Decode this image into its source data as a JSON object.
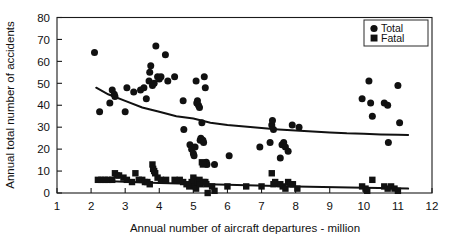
{
  "figure": {
    "cut_off_title": "",
    "background_color": "#ffffff",
    "ink_color": "#111111"
  },
  "legend": {
    "position": "top-right",
    "entries": [
      {
        "label": "Total",
        "marker": "circle-marker",
        "color": "#111111"
      },
      {
        "label": "Fatal",
        "marker": "square-marker",
        "color": "#111111"
      }
    ]
  },
  "axes": {
    "x_title": "Annual number of aircraft departures - million",
    "y_title": "Annual total number of accidents",
    "x_ticks": [
      "1",
      "2",
      "3",
      "4",
      "5",
      "6",
      "7",
      "8",
      "9",
      "10",
      "11",
      "12"
    ],
    "y_ticks": [
      "0",
      "10",
      "20",
      "30",
      "40",
      "50",
      "60",
      "70",
      "80"
    ]
  },
  "chart_data": {
    "type": "scatter",
    "title": "",
    "xlabel": "Annual number of aircraft departures - million",
    "ylabel": "Annual total number of accidents",
    "xlim": [
      1,
      12
    ],
    "ylim": [
      0,
      80
    ],
    "xticks": [
      1,
      2,
      3,
      4,
      5,
      6,
      7,
      8,
      9,
      10,
      11,
      12
    ],
    "yticks": [
      0,
      10,
      20,
      30,
      40,
      50,
      60,
      70,
      80
    ],
    "grid": false,
    "legend_position": "upper right",
    "series": [
      {
        "name": "Total",
        "marker": "circle",
        "color": "#111111",
        "points": [
          [
            2.1,
            64
          ],
          [
            2.25,
            37
          ],
          [
            2.55,
            41
          ],
          [
            2.62,
            47
          ],
          [
            2.68,
            45
          ],
          [
            2.7,
            44
          ],
          [
            3.0,
            37
          ],
          [
            3.05,
            48
          ],
          [
            3.25,
            46
          ],
          [
            3.45,
            47
          ],
          [
            3.55,
            48
          ],
          [
            3.62,
            43
          ],
          [
            3.7,
            51
          ],
          [
            3.72,
            55
          ],
          [
            3.75,
            58
          ],
          [
            3.8,
            49
          ],
          [
            3.85,
            50
          ],
          [
            3.9,
            67
          ],
          [
            3.95,
            53
          ],
          [
            4.0,
            52
          ],
          [
            4.05,
            53
          ],
          [
            4.18,
            63
          ],
          [
            4.25,
            51
          ],
          [
            4.45,
            53
          ],
          [
            4.7,
            42
          ],
          [
            4.72,
            29
          ],
          [
            4.9,
            22
          ],
          [
            4.95,
            20
          ],
          [
            5.0,
            18
          ],
          [
            5.02,
            17
          ],
          [
            5.05,
            21
          ],
          [
            5.08,
            51
          ],
          [
            5.1,
            41
          ],
          [
            5.12,
            42
          ],
          [
            5.15,
            40
          ],
          [
            5.18,
            39
          ],
          [
            5.2,
            24
          ],
          [
            5.22,
            25
          ],
          [
            5.25,
            32
          ],
          [
            5.28,
            24
          ],
          [
            5.3,
            23
          ],
          [
            5.32,
            53
          ],
          [
            5.35,
            48
          ],
          [
            5.38,
            14
          ],
          [
            5.4,
            13
          ],
          [
            5.62,
            13
          ],
          [
            6.05,
            17
          ],
          [
            6.95,
            21
          ],
          [
            7.25,
            23
          ],
          [
            7.3,
            31
          ],
          [
            7.32,
            33
          ],
          [
            7.35,
            29
          ],
          [
            7.55,
            16
          ],
          [
            7.6,
            22
          ],
          [
            7.65,
            23
          ],
          [
            7.7,
            21
          ],
          [
            7.78,
            19
          ],
          [
            7.9,
            31
          ],
          [
            8.1,
            30
          ],
          [
            9.95,
            43
          ],
          [
            10.15,
            51
          ],
          [
            10.2,
            41
          ],
          [
            10.25,
            35
          ],
          [
            10.6,
            41
          ],
          [
            10.7,
            40
          ],
          [
            10.72,
            23
          ],
          [
            11.0,
            49
          ],
          [
            11.05,
            32
          ]
        ]
      },
      {
        "name": "Fatal",
        "marker": "square",
        "color": "#111111",
        "points": [
          [
            2.2,
            6
          ],
          [
            2.3,
            6
          ],
          [
            2.4,
            6
          ],
          [
            2.5,
            6
          ],
          [
            2.62,
            6
          ],
          [
            2.7,
            9
          ],
          [
            2.75,
            8
          ],
          [
            2.82,
            8
          ],
          [
            2.95,
            7
          ],
          [
            3.05,
            6
          ],
          [
            3.2,
            5
          ],
          [
            3.3,
            9
          ],
          [
            3.4,
            6
          ],
          [
            3.5,
            6
          ],
          [
            3.58,
            5
          ],
          [
            3.65,
            5
          ],
          [
            3.72,
            4
          ],
          [
            3.8,
            13
          ],
          [
            3.82,
            11
          ],
          [
            3.85,
            10
          ],
          [
            3.88,
            9
          ],
          [
            3.95,
            7
          ],
          [
            4.05,
            6
          ],
          [
            4.2,
            6
          ],
          [
            4.45,
            6
          ],
          [
            4.6,
            6
          ],
          [
            4.7,
            5
          ],
          [
            4.8,
            4
          ],
          [
            4.88,
            3
          ],
          [
            4.95,
            5
          ],
          [
            5.0,
            7
          ],
          [
            5.02,
            6
          ],
          [
            5.05,
            3
          ],
          [
            5.08,
            2
          ],
          [
            5.12,
            5
          ],
          [
            5.18,
            6
          ],
          [
            5.2,
            4
          ],
          [
            5.25,
            14
          ],
          [
            5.28,
            13
          ],
          [
            5.3,
            5
          ],
          [
            5.35,
            5
          ],
          [
            5.38,
            4
          ],
          [
            5.42,
            0
          ],
          [
            5.55,
            3
          ],
          [
            5.62,
            1
          ],
          [
            6.0,
            3
          ],
          [
            6.55,
            3
          ],
          [
            7.0,
            3
          ],
          [
            7.3,
            9
          ],
          [
            7.35,
            4
          ],
          [
            7.4,
            5
          ],
          [
            7.55,
            4
          ],
          [
            7.62,
            3
          ],
          [
            7.7,
            2
          ],
          [
            7.78,
            5
          ],
          [
            7.85,
            4
          ],
          [
            7.92,
            4
          ],
          [
            8.05,
            2
          ],
          [
            9.95,
            3
          ],
          [
            10.05,
            2
          ],
          [
            10.1,
            1
          ],
          [
            10.25,
            6
          ],
          [
            10.6,
            3
          ],
          [
            10.7,
            2
          ],
          [
            10.8,
            3
          ],
          [
            10.9,
            2
          ],
          [
            11.0,
            1
          ]
        ]
      }
    ],
    "trendlines": [
      {
        "series": "Total",
        "shape": "power-decay",
        "points": [
          [
            2.15,
            48
          ],
          [
            2.5,
            45
          ],
          [
            3.0,
            42
          ],
          [
            3.5,
            39
          ],
          [
            4.0,
            37
          ],
          [
            4.5,
            35
          ],
          [
            5.0,
            34
          ],
          [
            5.5,
            32
          ],
          [
            6.0,
            31
          ],
          [
            6.5,
            30.3
          ],
          [
            7.0,
            29.6
          ],
          [
            7.5,
            29.0
          ],
          [
            8.0,
            28.5
          ],
          [
            8.5,
            28.0
          ],
          [
            9.0,
            27.6
          ],
          [
            9.5,
            27.2
          ],
          [
            10.0,
            27.0
          ],
          [
            10.5,
            26.7
          ],
          [
            11.0,
            26.5
          ],
          [
            11.3,
            26.4
          ]
        ]
      },
      {
        "series": "Fatal",
        "shape": "near-flat-decay",
        "points": [
          [
            2.15,
            5.6
          ],
          [
            4.0,
            4.6
          ],
          [
            6.0,
            3.8
          ],
          [
            8.0,
            3.0
          ],
          [
            10.0,
            2.4
          ],
          [
            11.3,
            2.0
          ]
        ]
      }
    ]
  }
}
